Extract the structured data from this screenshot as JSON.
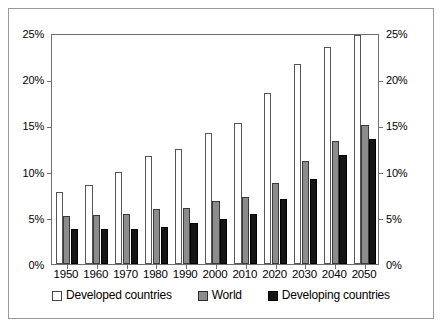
{
  "chart_data": {
    "type": "bar",
    "title": "",
    "xlabel": "",
    "ylabel": "",
    "ylim": [
      0,
      25
    ],
    "y_tick_values": [
      0,
      5,
      10,
      15,
      20,
      25
    ],
    "y_tick_labels": [
      "0%",
      "5%",
      "10%",
      "15%",
      "20%",
      "25%"
    ],
    "right_axis": true,
    "right_y_tick_labels": [
      "0%",
      "5%",
      "10%",
      "15%",
      "20%",
      "25%"
    ],
    "grid": false,
    "legend_position": "bottom",
    "categories": [
      "1950",
      "1960",
      "1970",
      "1980",
      "1990",
      "2000",
      "2010",
      "2020",
      "2030",
      "2040",
      "2050"
    ],
    "series": [
      {
        "name": "Developed countries",
        "color": "#ffffff",
        "values": [
          7.8,
          8.5,
          10.0,
          11.7,
          12.4,
          14.2,
          15.3,
          18.5,
          21.7,
          23.5,
          24.8
        ]
      },
      {
        "name": "World",
        "color": "#8c8c8c",
        "values": [
          5.2,
          5.3,
          5.4,
          5.9,
          6.1,
          6.8,
          7.2,
          8.8,
          11.1,
          13.3,
          15.0
        ]
      },
      {
        "name": "Developing countries",
        "color": "#151515",
        "values": [
          3.8,
          3.8,
          3.8,
          4.0,
          4.4,
          4.9,
          5.4,
          7.0,
          9.2,
          11.8,
          13.5
        ]
      }
    ]
  },
  "legend": {
    "items": [
      {
        "label": "Developed countries",
        "key": "developed"
      },
      {
        "label": "World",
        "key": "world"
      },
      {
        "label": "Developing countries",
        "key": "developing"
      }
    ]
  }
}
